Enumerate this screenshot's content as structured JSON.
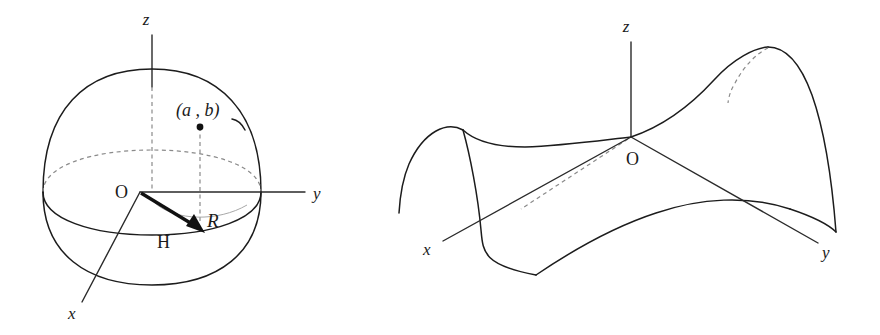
{
  "figure": {
    "background_color": "#ffffff",
    "line_color": "#1c1c1c",
    "dashed_color": "#8a8a8a",
    "faint_color": "#a8a8a8"
  },
  "left_diagram": {
    "name": "dome-with-radius-vector",
    "axes": {
      "z_label": "z",
      "y_label": "y",
      "x_label": "x"
    },
    "origin_label": "O",
    "point_label": "(a , b)",
    "vector_label": "H",
    "radius_label": "R"
  },
  "right_diagram": {
    "name": "saddle-surface",
    "axes": {
      "z_label": "z",
      "y_label": "y",
      "x_label": "x"
    },
    "origin_label": "O"
  }
}
